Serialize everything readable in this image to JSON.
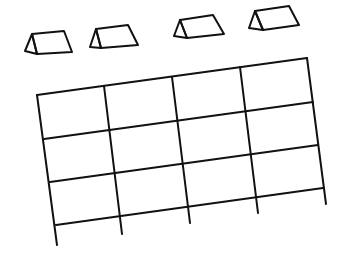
{
  "diagram": {
    "title": "",
    "description": "Line drawing of four tent-shaped table cards above a skewed 4-column by 3-row grid",
    "stroke_color": "#111111",
    "background": "#ffffff",
    "tents": [
      {
        "id": "tent-1",
        "back_left": [
          25,
          51
        ],
        "apex": [
          32,
          34
        ],
        "top_right": [
          64,
          31
        ],
        "bottom_right": [
          72,
          52
        ],
        "bottom_left": [
          37,
          54
        ]
      },
      {
        "id": "tent-2",
        "back_left": [
          90,
          47
        ],
        "apex": [
          96,
          29
        ],
        "top_right": [
          128,
          25
        ],
        "bottom_right": [
          138,
          45
        ],
        "bottom_left": [
          101,
          48
        ]
      },
      {
        "id": "tent-3",
        "back_left": [
          174,
          36
        ],
        "apex": [
          180,
          20
        ],
        "top_right": [
          213,
          15
        ],
        "bottom_right": [
          224,
          34
        ],
        "bottom_left": [
          187,
          38
        ]
      },
      {
        "id": "tent-4",
        "back_left": [
          249,
          28
        ],
        "apex": [
          255,
          11
        ],
        "top_right": [
          289,
          6
        ],
        "bottom_right": [
          299,
          25
        ],
        "bottom_left": [
          263,
          30
        ]
      }
    ],
    "grid": {
      "columns": 4,
      "rows": 3,
      "horizontal_lines": [
        [
          [
            37,
            95
          ],
          [
            307,
            58
          ]
        ],
        [
          [
            44,
            139
          ],
          [
            313,
            102
          ]
        ],
        [
          [
            50,
            182
          ],
          [
            318,
            145
          ]
        ],
        [
          [
            56,
            225
          ],
          [
            323,
            188
          ]
        ]
      ],
      "vertical_lines": [
        [
          [
            37,
            95
          ],
          [
            57,
            245
          ]
        ],
        [
          [
            104,
            86
          ],
          [
            122,
            234
          ]
        ],
        [
          [
            172,
            77
          ],
          [
            190,
            223
          ]
        ],
        [
          [
            240,
            67
          ],
          [
            258,
            213
          ]
        ],
        [
          [
            307,
            58
          ],
          [
            326,
            204
          ]
        ]
      ]
    }
  }
}
